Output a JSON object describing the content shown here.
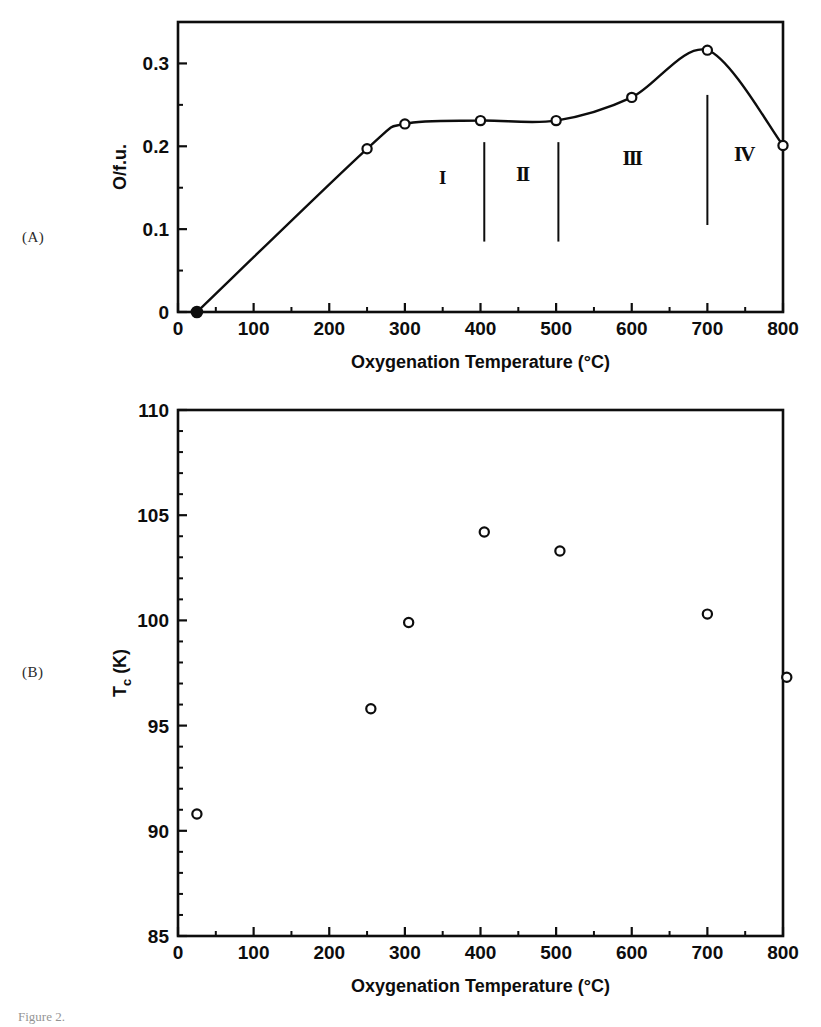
{
  "figure": {
    "panel_a_label": "(A)",
    "panel_b_label": "(B)",
    "caption": "Figure 2."
  },
  "colors": {
    "ink": "#0d0d0d",
    "background": "#ffffff",
    "marker_fill": "#ffffff",
    "marker_edge": "#0d0d0d"
  },
  "chart_data": [
    {
      "id": "panel-a",
      "type": "line",
      "title": "",
      "xlabel": "Oxygenation Temperature (°C)",
      "ylabel": "O/f.u.",
      "xlim": [
        0,
        800
      ],
      "ylim": [
        0,
        0.35
      ],
      "grid": false,
      "legend": "none",
      "xticks": [
        0,
        100,
        200,
        300,
        400,
        500,
        600,
        700,
        800
      ],
      "xticklabels": [
        "0",
        "100",
        "200",
        "300",
        "400",
        "500",
        "600",
        "700",
        "800"
      ],
      "xminorticks": [
        50,
        150,
        250,
        350,
        450,
        550,
        650,
        750
      ],
      "yticks": [
        0,
        0.1,
        0.2,
        0.3
      ],
      "yticklabels": [
        "0",
        "0.1",
        "0.2",
        "0.3"
      ],
      "yminorticks": [
        0.05,
        0.15,
        0.25,
        0.35
      ],
      "x": [
        25,
        250,
        300,
        400,
        500,
        600,
        700,
        800
      ],
      "values": [
        0.0,
        0.197,
        0.227,
        0.231,
        0.231,
        0.259,
        0.316,
        0.201
      ],
      "marker_styles": [
        "filled",
        "open",
        "open",
        "open",
        "open",
        "open",
        "open",
        "open"
      ],
      "annotations": [
        {
          "text": "I",
          "x": 350,
          "y": 0.155,
          "bold": false
        },
        {
          "text": "II",
          "x": 455,
          "y": 0.158,
          "bold": true
        },
        {
          "text": "III",
          "x": 600,
          "y": 0.178,
          "bold": true
        },
        {
          "text": "IV",
          "x": 748,
          "y": 0.182,
          "bold": true
        }
      ],
      "dividers": [
        {
          "x": 405,
          "y0": 0.085,
          "y1": 0.205
        },
        {
          "x": 503,
          "y0": 0.085,
          "y1": 0.205
        },
        {
          "x": 700,
          "y0": 0.105,
          "y1": 0.262
        }
      ]
    },
    {
      "id": "panel-b",
      "type": "scatter",
      "title": "",
      "xlabel": "Oxygenation Temperature (°C)",
      "ylabel": "Tc (K)",
      "ylabel_main": "T",
      "ylabel_sub": "c",
      "ylabel_tail": " (K)",
      "xlim": [
        0,
        800
      ],
      "ylim": [
        85,
        110
      ],
      "grid": false,
      "legend": "none",
      "xticks": [
        0,
        100,
        200,
        300,
        400,
        500,
        600,
        700,
        800
      ],
      "xticklabels": [
        "0",
        "100",
        "200",
        "300",
        "400",
        "500",
        "600",
        "700",
        "800"
      ],
      "xminorticks": [
        50,
        150,
        250,
        350,
        450,
        550,
        650,
        750
      ],
      "yticks": [
        85,
        90,
        95,
        100,
        105,
        110
      ],
      "yticklabels": [
        "85",
        "90",
        "95",
        "100",
        "105",
        "110"
      ],
      "yminorticks": [
        86,
        87,
        88,
        89,
        91,
        92,
        93,
        94,
        96,
        97,
        98,
        99,
        101,
        102,
        103,
        104,
        106,
        107,
        108,
        109
      ],
      "x": [
        25,
        255,
        305,
        405,
        505,
        700,
        805
      ],
      "values": [
        90.8,
        95.8,
        99.9,
        104.2,
        103.3,
        100.3,
        97.3
      ],
      "marker_styles": [
        "open",
        "open",
        "open",
        "open",
        "open",
        "open",
        "open"
      ]
    }
  ]
}
